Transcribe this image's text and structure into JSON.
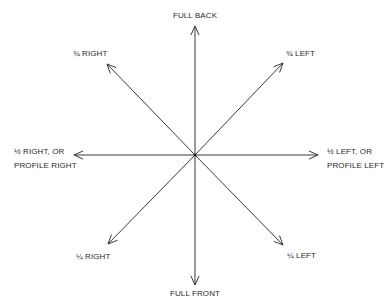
{
  "diagram": {
    "center": [
      195,
      155
    ],
    "stroke_color": "#3a3a3a",
    "label_color": "#2a2a2a",
    "background": "#ffffff",
    "arrows": [
      {
        "name": "full-back",
        "tip": [
          195,
          26
        ]
      },
      {
        "name": "three-quarter-left",
        "tip": [
          283,
          63
        ]
      },
      {
        "name": "half-left",
        "tip": [
          318,
          155
        ]
      },
      {
        "name": "quarter-left",
        "tip": [
          283,
          245
        ]
      },
      {
        "name": "full-front",
        "tip": [
          195,
          285
        ]
      },
      {
        "name": "quarter-right",
        "tip": [
          108,
          244
        ]
      },
      {
        "name": "half-right",
        "tip": [
          74,
          155
        ]
      },
      {
        "name": "three-quarter-right",
        "tip": [
          107,
          64
        ]
      }
    ],
    "labels": {
      "full_back": "FULL BACK",
      "three_quarter_left": "¾ LEFT",
      "half_left_line1": "½ LEFT, OR",
      "half_left_line2": "PROFILE LEFT",
      "quarter_left": "¼ LEFT",
      "full_front": "FULL FRONT",
      "quarter_right": "¼ RIGHT",
      "half_right_line1": "½ RIGHT, OR",
      "half_right_line2": "PROFILE RIGHT",
      "three_quarter_right": "¾ RIGHT"
    }
  }
}
